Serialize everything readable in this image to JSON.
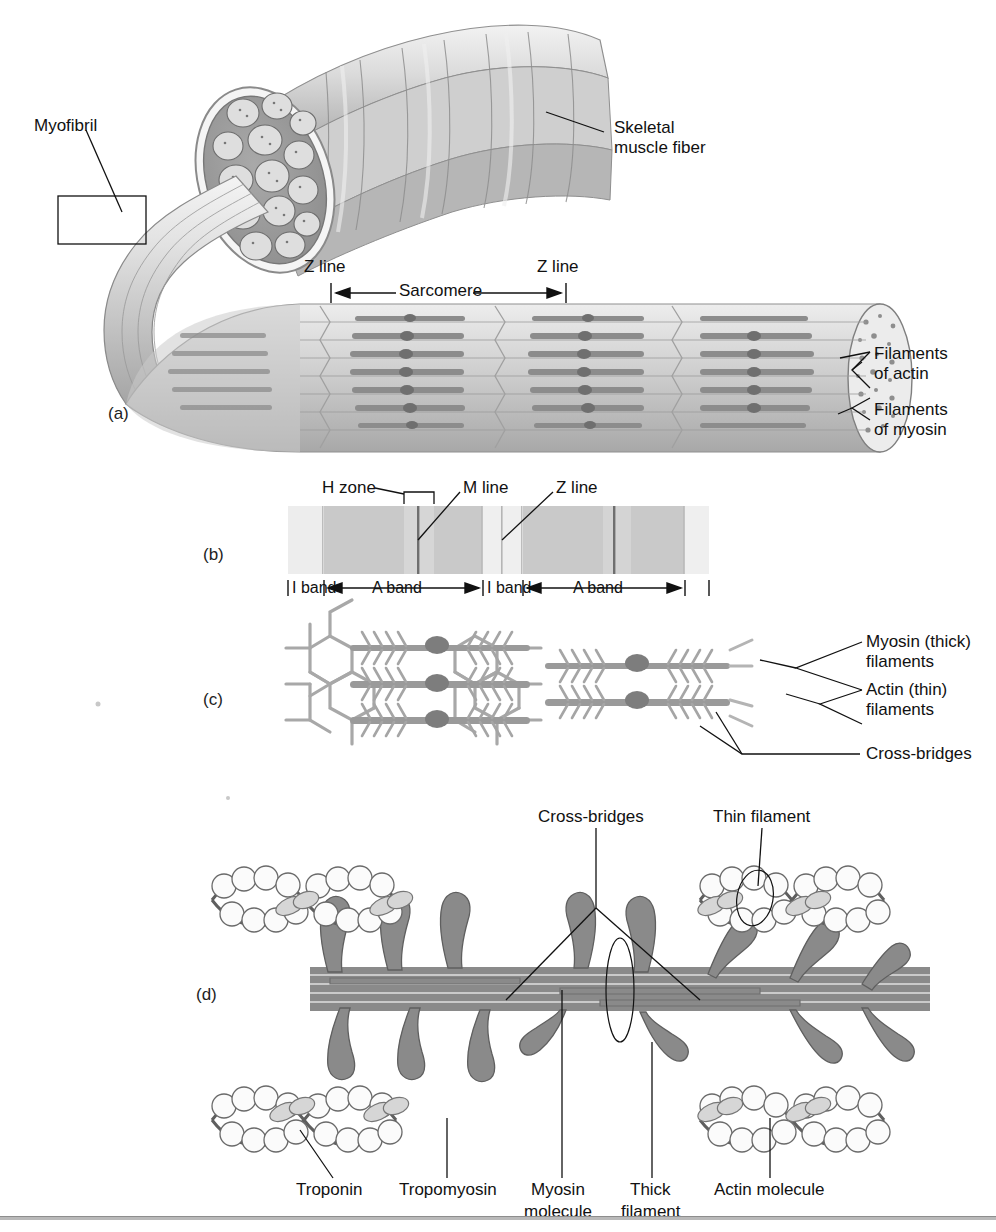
{
  "figure": {
    "background": "#ffffff"
  },
  "colors": {
    "ink": "#111111",
    "filament_gray": "#8a8a8a",
    "filament_dark": "#6f6f6f",
    "a_band": "#c9c9c9",
    "i_band": "#ededed",
    "z_line": "#9a9a9a",
    "m_line": "#7b7b7b",
    "muscle_light": "#e6e6e6",
    "muscle_mid": "#c2c2c2",
    "muscle_dark": "#9b9b9b",
    "rule": "#b9b9b9"
  },
  "panel_a": {
    "letter": "(a)",
    "labels": {
      "myofibril": "Myofibril",
      "skeletal_muscle_fiber_line1": "Skeletal",
      "skeletal_muscle_fiber_line2": "muscle fiber",
      "z_line_left": "Z line",
      "z_line_right": "Z line",
      "sarcomere": "Sarcomere",
      "filaments_of_actin_line1": "Filaments",
      "filaments_of_actin_line2": "of actin",
      "filaments_of_myosin_line1": "Filaments",
      "filaments_of_myosin_line2": "of myosin"
    }
  },
  "panel_b": {
    "letter": "(b)",
    "labels": {
      "h_zone": "H zone",
      "m_line": "M line",
      "z_line": "Z line",
      "i_band_1": "I band",
      "a_band_1": "A band",
      "i_band_2": "I band",
      "a_band_2": "A band"
    },
    "bands": [
      {
        "name": "I band",
        "type": "I",
        "x": 288,
        "width": 36
      },
      {
        "name": "A band",
        "type": "A",
        "x": 324,
        "width": 159
      },
      {
        "name": "I band",
        "type": "I",
        "x": 483,
        "width": 40
      },
      {
        "name": "A band",
        "type": "A",
        "x": 523,
        "width": 162
      },
      {
        "name": "I band edge",
        "type": "I",
        "x": 685,
        "width": 24
      }
    ]
  },
  "panel_c": {
    "letter": "(c)",
    "labels": {
      "myosin_thick_line1": "Myosin (thick)",
      "myosin_thick_line2": "filaments",
      "actin_thin_line1": "Actin (thin)",
      "actin_thin_line2": "filaments",
      "cross_bridges": "Cross-bridges"
    }
  },
  "panel_d": {
    "letter": "(d)",
    "labels": {
      "cross_bridges": "Cross-bridges",
      "thin_filament": "Thin filament",
      "troponin": "Troponin",
      "tropomyosin": "Tropomyosin",
      "myosin_molecule_line1": "Myosin",
      "myosin_molecule_line2": "molecule",
      "thick_filament_line1": "Thick",
      "thick_filament_line2": "filament",
      "actin_molecule": "Actin molecule"
    }
  }
}
